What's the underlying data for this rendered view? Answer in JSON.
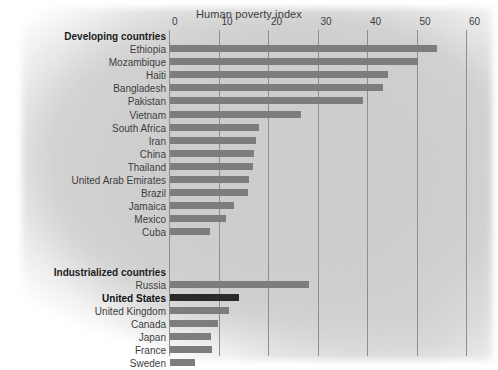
{
  "chart_data": {
    "type": "bar",
    "title": "Human poverty index",
    "xlabel": "Human poverty index",
    "ylabel": "",
    "orientation": "horizontal",
    "xlim": [
      0,
      60
    ],
    "xticks": [
      0,
      10,
      20,
      30,
      40,
      50,
      60
    ],
    "xtick_labels": [
      "0",
      "10",
      "20",
      "30",
      "40",
      "50",
      "60"
    ],
    "grid": true,
    "legend": "none",
    "groups": [
      {
        "name": "Developing countries",
        "categories": [
          "Ethiopia",
          "Mozambique",
          "Haiti",
          "Bangladesh",
          "Pakistan",
          "Vietnam",
          "South Africa",
          "Iran",
          "China",
          "Thailand",
          "United Arab Emirates",
          "Brazil",
          "Jamaica",
          "Mexico",
          "Cuba"
        ],
        "values": [
          54,
          50,
          44,
          43,
          39,
          26.5,
          18,
          17.4,
          17,
          16.8,
          16,
          15.7,
          13,
          11.3,
          8
        ]
      },
      {
        "name": "Industrialized countries",
        "categories": [
          "Russia",
          "United States",
          "United Kingdom",
          "Canada",
          "Japan",
          "France",
          "Sweden"
        ],
        "values": [
          28,
          14,
          12,
          9.7,
          8.2,
          8.5,
          5
        ]
      }
    ],
    "highlighted_category": "United States",
    "colors": {
      "bar": "#7d7d7d",
      "bar_highlight": "#2a2a2a",
      "background": "#d2d2d2",
      "gridline": "#8e8e8e",
      "text": "#3d3d3d"
    }
  }
}
